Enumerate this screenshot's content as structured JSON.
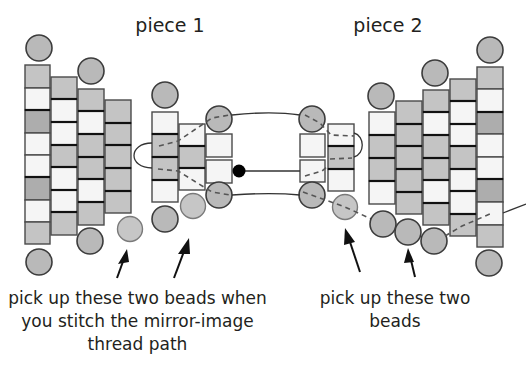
{
  "titles": {
    "piece1": "piece 1",
    "piece2": "piece 2"
  },
  "captions": {
    "left": [
      "pick up these two beads when",
      "you stitch the mirror-image",
      "thread path"
    ],
    "right": [
      "pick up these two",
      "beads"
    ]
  },
  "colors": {
    "bead_gray": "#bfbfbf",
    "bead_dark": "#a9a9a9",
    "bead_light": "#f4f4f4",
    "outline": "#231f20",
    "thread": "#3a3a3a",
    "dashed": "#555555",
    "knot": "#000000"
  }
}
